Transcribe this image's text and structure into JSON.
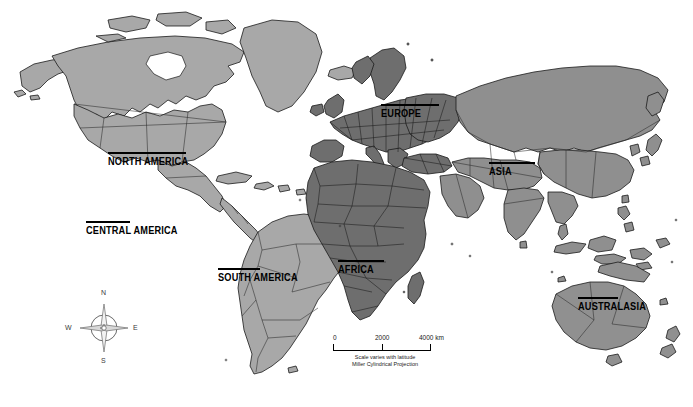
{
  "map": {
    "title": "World Map",
    "projection_note_line1": "Scale varies with latitude",
    "projection_note_line2": "Miller Cylindrical Projection",
    "background_color": "#ffffff",
    "border_color": "#1a1a1a"
  },
  "continent_labels": [
    {
      "id": "north-america",
      "text": "NORTH AMERICA"
    },
    {
      "id": "central-america",
      "text": "CENTRAL AMERICA"
    },
    {
      "id": "south-america",
      "text": "SOUTH AMERICA"
    },
    {
      "id": "europe",
      "text": "EUROPE"
    },
    {
      "id": "africa",
      "text": "AFRICA"
    },
    {
      "id": "asia",
      "text": "ASIA"
    },
    {
      "id": "australasia",
      "text": "AUSTRALASIA"
    }
  ],
  "compass": {
    "north": "N",
    "east": "E",
    "south": "S",
    "west": "W"
  },
  "scale_bar": {
    "ticks": [
      "0",
      "2000",
      "4000 km"
    ],
    "unit": "km",
    "max_value": 4000
  },
  "legend_colors": {
    "americas_fill": "#a8a8a8",
    "africa_europe_fill": "#6e6e6e",
    "asia_fill": "#8f8f8f",
    "australasia_fill": "#909090",
    "ocean_fill": "#ffffff",
    "outline": "#1a1a1a"
  }
}
